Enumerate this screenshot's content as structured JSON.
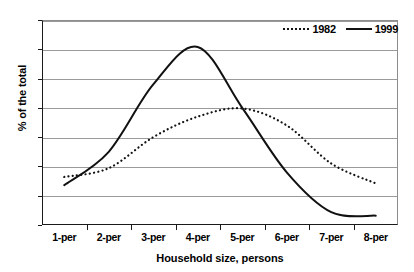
{
  "chart_data": {
    "type": "line",
    "title": "",
    "xlabel": "Household size, persons",
    "ylabel": "% of the total",
    "categories": [
      "1-per",
      "2-per",
      "3-per",
      "4-per",
      "5-per",
      "6-per",
      "7-per",
      "8-per"
    ],
    "ylim": [
      0,
      35
    ],
    "yticks": [
      0,
      5,
      10,
      15,
      20,
      25,
      30,
      35
    ],
    "grid": true,
    "legend_position": "top-right",
    "series": [
      {
        "name": "1982",
        "style": "dotted",
        "color": "#111111",
        "values": [
          8.2,
          9.7,
          15.0,
          18.5,
          19.9,
          17.0,
          10.5,
          7.1
        ]
      },
      {
        "name": "1999",
        "style": "solid",
        "color": "#111111",
        "values": [
          6.8,
          12.5,
          24.0,
          30.4,
          20.0,
          9.0,
          2.2,
          1.6
        ]
      }
    ]
  },
  "axes": {
    "y_title": "% of the total",
    "x_title": "Household size, persons"
  },
  "legend": {
    "items": [
      {
        "label": "1982",
        "style": "dotted"
      },
      {
        "label": "1999",
        "style": "solid"
      }
    ]
  }
}
